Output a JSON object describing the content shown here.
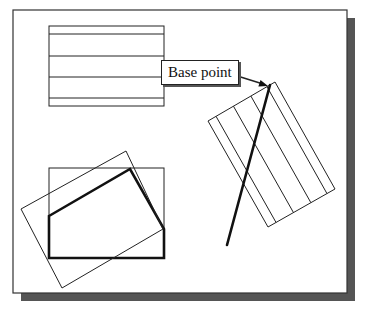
{
  "diagram": {
    "callout_label": "Base point",
    "colors": {
      "background": "#ffffff",
      "frame": "#333333",
      "shadow": "#555555",
      "line": "#222222"
    },
    "frame": {
      "x": 13,
      "y": 10,
      "w": 334,
      "h": 283,
      "shadow_offset": 8
    },
    "shapes": {
      "top_rect": {
        "x": 49,
        "y": 26,
        "w": 115,
        "h": 80,
        "inner_lines_y": [
          34,
          56,
          77,
          98
        ]
      },
      "rotated_hatched_rect": {
        "corners": [
          [
            275,
            82
          ],
          [
            335,
            189
          ],
          [
            268,
            227
          ],
          [
            208,
            121
          ]
        ],
        "inner_line_fractions": [
          0.12,
          0.38,
          0.64,
          0.88
        ]
      },
      "thick_line": {
        "from": [
          270,
          85
        ],
        "to": [
          227,
          245
        ]
      },
      "arrow": {
        "from": [
          231,
          74
        ],
        "to": [
          268,
          86
        ]
      },
      "bottom_rect": {
        "x": 49,
        "y": 168,
        "w": 115,
        "h": 90
      },
      "polygon": [
        [
          49,
          216
        ],
        [
          130,
          169
        ],
        [
          164,
          229
        ],
        [
          164,
          258
        ],
        [
          49,
          258
        ]
      ],
      "rotated_rect": [
        [
          21,
          209
        ],
        [
          126,
          151
        ],
        [
          163,
          229
        ],
        [
          62,
          288
        ]
      ]
    }
  }
}
